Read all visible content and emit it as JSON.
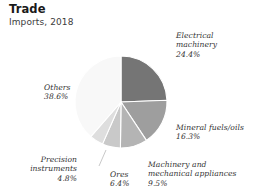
{
  "header": {
    "title": "Trade",
    "subtitle": "Imports, 2018"
  },
  "chart_data": {
    "type": "pie",
    "title": "Trade",
    "subtitle": "Imports, 2018",
    "xlabel": "",
    "ylabel": "",
    "legend_position": "none",
    "grid": false,
    "units": "percent",
    "start_angle_deg": 0,
    "direction": "clockwise",
    "categories": [
      "Electrical machinery",
      "Mineral fuels/oils",
      "Machinery and mechanical appliances",
      "Ores",
      "Precision instruments",
      "Others"
    ],
    "values": [
      24.4,
      16.3,
      9.5,
      6.4,
      4.8,
      38.6
    ],
    "colors": [
      "#757575",
      "#9e9e9e",
      "#b4b4b4",
      "#c9c9c9",
      "#dedede",
      "#f8f8f8"
    ],
    "slices": [
      {
        "name": "Electrical machinery",
        "value": 24.4,
        "value_label": "24.4%",
        "color": "#757575",
        "label_line1": "Electrical",
        "label_line2": "machinery",
        "label_line3": "24.4%"
      },
      {
        "name": "Mineral fuels/oils",
        "value": 16.3,
        "value_label": "16.3%",
        "color": "#9e9e9e",
        "label_line1": "Mineral fuels/oils",
        "label_line2": "16.3%",
        "label_line3": ""
      },
      {
        "name": "Machinery and mechanical appliances",
        "value": 9.5,
        "value_label": "9.5%",
        "color": "#b4b4b4",
        "label_line1": "Machinery and",
        "label_line2": "mechanical appliances",
        "label_line3": "9.5%"
      },
      {
        "name": "Ores",
        "value": 6.4,
        "value_label": "6.4%",
        "color": "#c9c9c9",
        "label_line1": "Ores",
        "label_line2": "6.4%",
        "label_line3": ""
      },
      {
        "name": "Precision instruments",
        "value": 4.8,
        "value_label": "4.8%",
        "color": "#dedede",
        "label_line1": "Precision",
        "label_line2": "instruments",
        "label_line3": "4.8%"
      },
      {
        "name": "Others",
        "value": 38.6,
        "value_label": "38.6%",
        "color": "#f8f8f8",
        "label_line1": "Others",
        "label_line2": "38.6%",
        "label_line3": ""
      }
    ]
  }
}
